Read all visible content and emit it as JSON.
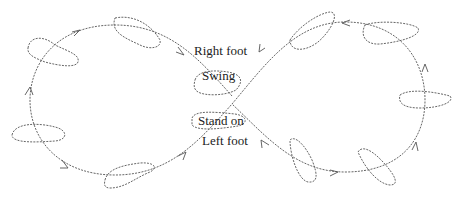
{
  "diagram": {
    "type": "figure-eight walking path with footprints",
    "labels": {
      "right_foot": "Right foot",
      "swing": "Swing",
      "stand_on": "Stand on",
      "left_foot": "Left foot"
    },
    "colors": {
      "stroke": "#555555",
      "text": "#222222",
      "background": "#ffffff"
    }
  }
}
